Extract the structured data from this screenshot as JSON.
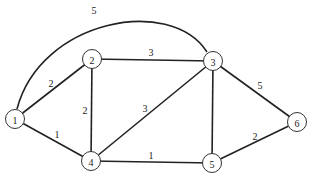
{
  "graph": {
    "type": "weighted-undirected-graph",
    "nodes": [
      {
        "id": "1",
        "label": "1",
        "x": 15,
        "y": 119
      },
      {
        "id": "2",
        "label": "2",
        "x": 92,
        "y": 59
      },
      {
        "id": "3",
        "label": "3",
        "x": 213,
        "y": 61
      },
      {
        "id": "4",
        "label": "4",
        "x": 91,
        "y": 161
      },
      {
        "id": "5",
        "label": "5",
        "x": 212,
        "y": 163
      },
      {
        "id": "6",
        "label": "6",
        "x": 297,
        "y": 122
      }
    ],
    "edges": [
      {
        "from": "1",
        "to": "3",
        "weight": "5",
        "curved": true
      },
      {
        "from": "1",
        "to": "2",
        "weight": "2"
      },
      {
        "from": "1",
        "to": "4",
        "weight": "1"
      },
      {
        "from": "2",
        "to": "3",
        "weight": "3"
      },
      {
        "from": "2",
        "to": "4",
        "weight": "2"
      },
      {
        "from": "3",
        "to": "4",
        "weight": "3"
      },
      {
        "from": "3",
        "to": "5",
        "weight": ""
      },
      {
        "from": "3",
        "to": "6",
        "weight": "5"
      },
      {
        "from": "4",
        "to": "5",
        "weight": "1"
      },
      {
        "from": "5",
        "to": "6",
        "weight": "2"
      }
    ]
  },
  "labels": {
    "n1": "1",
    "n2": "2",
    "n3": "3",
    "n4": "4",
    "n5": "5",
    "n6": "6",
    "w13": "5",
    "w12": "2",
    "w14": "1",
    "w23": "3",
    "w24": "2",
    "w34": "3",
    "w36": "5",
    "w45": "1",
    "w56": "2"
  },
  "colors": {
    "edge": "#222222",
    "node_stroke": "#333333",
    "background": "#ffffff"
  }
}
